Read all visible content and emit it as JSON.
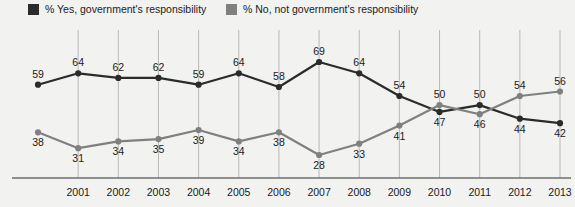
{
  "legend": {
    "items": [
      {
        "label": "% Yes, government's responsibility",
        "color": "#2b2b2b",
        "icon": "legend-swatch"
      },
      {
        "label": "% No, not government's responsibility",
        "color": "#808080",
        "icon": "legend-swatch"
      }
    ]
  },
  "chart_data": {
    "type": "line",
    "title": "",
    "xlabel": "",
    "ylabel": "",
    "ylim": [
      20,
      75
    ],
    "grid": true,
    "legend_position": "top",
    "categories": [
      "",
      "2001",
      "2002",
      "2003",
      "2004",
      "2005",
      "2006",
      "2007",
      "2008",
      "2009",
      "2010",
      "2011",
      "2012",
      "2013"
    ],
    "series": [
      {
        "name": "% Yes, government's responsibility",
        "color": "#2b2b2b",
        "values": [
          59,
          64,
          62,
          62,
          59,
          64,
          58,
          69,
          64,
          54,
          47,
          50,
          44,
          42
        ]
      },
      {
        "name": "% No, not government's responsibility",
        "color": "#808080",
        "values": [
          38,
          31,
          34,
          35,
          39,
          34,
          38,
          28,
          33,
          41,
          50,
          46,
          54,
          56
        ]
      }
    ]
  }
}
